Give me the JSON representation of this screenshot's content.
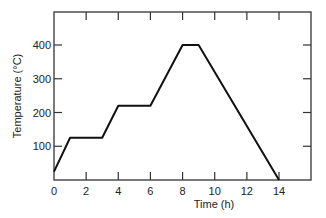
{
  "chart_data": {
    "type": "line",
    "title": "",
    "xlabel": "Time (h)",
    "ylabel": "Temperature (°C)",
    "xlim": [
      0,
      16
    ],
    "ylim": [
      0,
      500
    ],
    "xticks": [
      0,
      2,
      4,
      6,
      8,
      10,
      12,
      14
    ],
    "yticks": [
      100,
      200,
      300,
      400
    ],
    "grid": false,
    "legend": null,
    "series": [
      {
        "name": "Temperature profile",
        "x": [
          0,
          1,
          3,
          4,
          6,
          8,
          9,
          14
        ],
        "y": [
          25,
          125,
          125,
          220,
          220,
          400,
          400,
          0
        ]
      }
    ],
    "colors": {
      "line": "#111111",
      "axes": "#333333"
    }
  }
}
